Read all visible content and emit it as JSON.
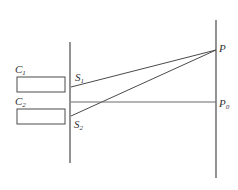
{
  "diagram": {
    "type": "double-slit interference setup",
    "colors": {
      "line": "#4a4a4a",
      "background": "#ffffff",
      "text": "#333333"
    },
    "labels": {
      "c1": {
        "main": "C",
        "sub": "1"
      },
      "c2": {
        "main": "C",
        "sub": "2"
      },
      "s1": {
        "main": "S",
        "sub": "1"
      },
      "s2": {
        "main": "S",
        "sub": "2"
      },
      "p": {
        "main": "P"
      },
      "p0": {
        "main": "P",
        "sub": "0"
      }
    },
    "elements": {
      "slit_barrier": {
        "x": 70,
        "y1": 42,
        "y2": 163
      },
      "screen": {
        "x": 216,
        "y1": 20,
        "y2": 178
      },
      "source_c1": {
        "x": 17,
        "y": 77,
        "width": 48,
        "height": 15
      },
      "source_c2": {
        "x": 17,
        "y": 109,
        "width": 48,
        "height": 15
      },
      "slit_s1": {
        "x": 70,
        "y": 87
      },
      "slit_s2": {
        "x": 70,
        "y": 116
      },
      "point_p": {
        "x": 216,
        "y": 50
      },
      "point_p0": {
        "x": 216,
        "y": 102
      }
    }
  }
}
